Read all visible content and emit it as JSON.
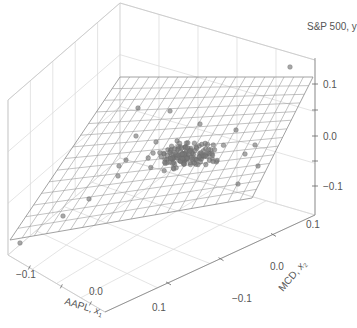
{
  "chart_data": {
    "type": "scatter3d",
    "title": "",
    "subtitle": "",
    "xlabel": "AAPL, x₁",
    "ylabel": "MCD, x₂",
    "zlabel": "S&P 500, y",
    "x_ticks": [
      "−0.1",
      "0.0",
      "0.1"
    ],
    "y_ticks": [
      "−0.1",
      "0.0",
      "0.1"
    ],
    "z_ticks": [
      "0.1",
      "0.0",
      "−0.1"
    ],
    "xlim": [
      -0.15,
      0.15
    ],
    "ylim": [
      -0.15,
      0.15
    ],
    "zlim": [
      -0.15,
      0.15
    ],
    "grid": true,
    "legend": null,
    "surface": {
      "type": "regression-plane",
      "description": "Fitted plane y = b0 + b1*x1 + b2*x2 shown as wireframe mesh",
      "mesh_lines_u": 20,
      "mesh_lines_v": 14
    },
    "series": [
      {
        "name": "monthly returns",
        "type": "scatter",
        "color": "#7a7a7a",
        "approx_center": {
          "x1": 0.01,
          "x2": 0.01,
          "y": 0.01
        },
        "n_points_approx": 150
      }
    ],
    "colors": {
      "points": "#7a7a7a",
      "plane": "#9a9a9a",
      "grid": "#d8d8d8",
      "text": "#555555"
    }
  },
  "labels": {
    "z_axis": "S&P 500, y",
    "x_axis_name": "AAPL, ",
    "x_axis_var": "x",
    "x_axis_sub": "1",
    "y_axis_name": "MCD, ",
    "y_axis_var": "x",
    "y_axis_sub": "2",
    "z_tick_top": "0.1",
    "z_tick_mid": "0.0",
    "z_tick_bot": "−0.1",
    "x_tick_0": "−0.1",
    "x_tick_1": "0.0",
    "x_tick_2": "0.1",
    "y_tick_0": "−0.1",
    "y_tick_1": "0.0",
    "y_tick_2": "0.1"
  }
}
